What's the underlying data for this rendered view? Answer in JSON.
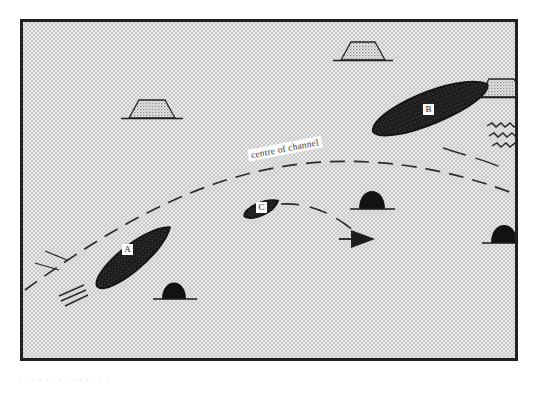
{
  "figure": {
    "type": "nautical-situation-diagram",
    "frame": {
      "border_color": "#211f1f",
      "fill_color": "#e0e0e0",
      "x": 20,
      "y": 19,
      "width": 498,
      "height": 342
    },
    "annotations": {
      "channel_label": "centre of channel"
    },
    "vessels": [
      {
        "id": "A",
        "label": "A",
        "description": "large vessel heading up-channel (north-east), hatched hull, wake astern to the south-west",
        "heading_degrees": 52,
        "position": {
          "x": 132,
          "y": 254
        },
        "hull_length_px": 95,
        "hull_beam_px": 36,
        "fill": "hatched-dark"
      },
      {
        "id": "B",
        "label": "B",
        "description": "large vessel heading up-left (north-west), hatched hull, wake astern to the south-east",
        "heading_degrees": 300,
        "position": {
          "x": 432,
          "y": 110
        },
        "hull_length_px": 120,
        "hull_beam_px": 45,
        "fill": "hatched-dark"
      },
      {
        "id": "C",
        "label": "C",
        "description": "small craft near centre of channel, hatched hull",
        "heading_degrees": 20,
        "position": {
          "x": 259,
          "y": 207
        },
        "hull_length_px": 36,
        "hull_beam_px": 17,
        "fill": "hatched-dark"
      }
    ],
    "landmarks": [
      {
        "name": "hill-left",
        "shape": "trapezoid-stippled",
        "x": 140,
        "y": 114,
        "width": 44,
        "height": 21
      },
      {
        "name": "hill-top-centre",
        "shape": "trapezoid-stippled",
        "x": 351,
        "y": 55,
        "width": 42,
        "height": 20
      },
      {
        "name": "hill-right-edge",
        "shape": "trapezoid-stippled",
        "x": 494,
        "y": 90,
        "width": 42,
        "height": 20
      }
    ],
    "buoys": [
      {
        "name": "buoy-lower-left",
        "shape": "dome-solid-black",
        "x": 170,
        "y": 297,
        "width": 24,
        "height": 30
      },
      {
        "name": "buoy-centre",
        "shape": "dome-solid-black",
        "x": 368,
        "y": 204,
        "width": 24,
        "height": 30
      },
      {
        "name": "buoy-right",
        "shape": "dome-solid-black",
        "x": 499,
        "y": 238,
        "width": 24,
        "height": 30
      }
    ],
    "paths": [
      {
        "name": "centre-of-channel-line",
        "style": "dashed",
        "description": "long dashed arc sweeping from lower-left up across the middle and down to the right edge"
      },
      {
        "name": "course-arrow",
        "style": "dashed-with-arrowhead",
        "description": "short dashed curve from vessel C bending down-right, terminating in a solid arrowhead pointing right"
      }
    ],
    "colors": {
      "border": "#211f1f",
      "water": "#e0e0e0",
      "hull": "#3b3b3b",
      "buoy": "#111111",
      "hill": "#8f8f8f",
      "label_background": "#fbfbfb"
    }
  },
  "caption": {
    "cropped_text_below_frame": "· · · · · · · · · · · · · ·"
  }
}
